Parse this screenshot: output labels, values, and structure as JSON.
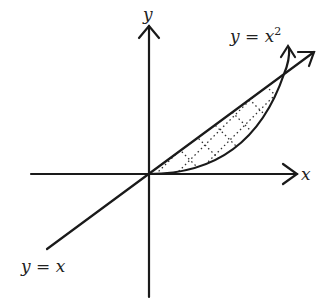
{
  "diagram": {
    "axes": {
      "x_label": "x",
      "y_label": "y"
    },
    "curves": [
      {
        "name": "line",
        "label": "y = x",
        "label_left": "y = x"
      },
      {
        "name": "parabola",
        "label_base": "y = x",
        "label_exp": "2"
      }
    ],
    "region": {
      "description": "area between y = x and y = x^2 for 0 ≤ x ≤ 1",
      "fill": "dotted hatch"
    },
    "colors": {
      "stroke": "#1a1a1a",
      "background": "#ffffff"
    }
  }
}
